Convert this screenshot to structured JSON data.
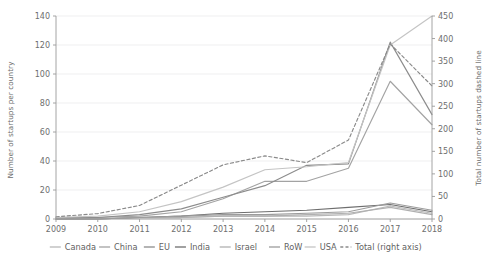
{
  "chart_data": {
    "type": "line",
    "title": "",
    "xlabel": "",
    "ylabel": "Number of startups per country",
    "y2label": "Total number of startups dashed line",
    "categories": [
      2009,
      2010,
      2011,
      2012,
      2013,
      2014,
      2015,
      2016,
      2017,
      2018
    ],
    "x": [
      2009,
      2010,
      2011,
      2012,
      2013,
      2014,
      2015,
      2016,
      2017,
      2018
    ],
    "xlim": [
      2009,
      2018
    ],
    "ylim": [
      0,
      140
    ],
    "y2lim": [
      0,
      450
    ],
    "yticks": [
      0,
      20,
      40,
      60,
      80,
      100,
      120,
      140
    ],
    "y2ticks": [
      0,
      50,
      100,
      150,
      200,
      250,
      300,
      350,
      400,
      450
    ],
    "xticks": [
      "2009",
      "2010",
      "2011",
      "2012",
      "2013",
      "2014",
      "2015",
      "2016",
      "2017",
      "2018"
    ],
    "grid": true,
    "legend_position": "bottom",
    "series": [
      {
        "name": "Canada",
        "axis": "left",
        "color": "#b8b8b8",
        "style": "solid",
        "values": [
          0,
          0,
          1,
          1,
          2,
          2,
          2,
          3,
          9,
          4
        ]
      },
      {
        "name": "China",
        "axis": "left",
        "color": "#a3a3a3",
        "style": "solid",
        "values": [
          0,
          1,
          2,
          5,
          14,
          26,
          26,
          35,
          95,
          65
        ]
      },
      {
        "name": "EU",
        "axis": "left",
        "color": "#8c8c8c",
        "style": "solid",
        "values": [
          1,
          1,
          3,
          7,
          15,
          23,
          37,
          38,
          122,
          72
        ]
      },
      {
        "name": "India",
        "axis": "left",
        "color": "#6e6e6e",
        "style": "solid",
        "values": [
          0,
          0,
          1,
          2,
          4,
          5,
          6,
          8,
          10,
          5
        ]
      },
      {
        "name": "Israel",
        "axis": "left",
        "color": "#b0b0b0",
        "style": "solid",
        "values": [
          0,
          0,
          1,
          1,
          2,
          2,
          3,
          4,
          8,
          3
        ]
      },
      {
        "name": "RoW",
        "axis": "left",
        "color": "#9c9c9c",
        "style": "solid",
        "values": [
          0,
          0,
          1,
          2,
          3,
          3,
          4,
          5,
          11,
          6
        ]
      },
      {
        "name": "USA",
        "axis": "left",
        "color": "#c4c4c4",
        "style": "solid",
        "values": [
          1,
          2,
          5,
          12,
          22,
          34,
          36,
          39,
          120,
          140
        ]
      },
      {
        "name": "Total (right axis)",
        "axis": "right",
        "color": "#8a8a8a",
        "style": "dashed",
        "values": [
          5,
          12,
          30,
          75,
          120,
          140,
          125,
          175,
          388,
          295
        ]
      }
    ]
  },
  "legend": {
    "entries": [
      {
        "label": "Canada",
        "color": "#b8b8b8",
        "style": "solid"
      },
      {
        "label": "China",
        "color": "#a3a3a3",
        "style": "solid"
      },
      {
        "label": "EU",
        "color": "#8c8c8c",
        "style": "solid"
      },
      {
        "label": "India",
        "color": "#6e6e6e",
        "style": "solid"
      },
      {
        "label": "Israel",
        "color": "#b0b0b0",
        "style": "solid"
      },
      {
        "label": "RoW",
        "color": "#9c9c9c",
        "style": "solid"
      },
      {
        "label": "USA",
        "color": "#c4c4c4",
        "style": "solid"
      },
      {
        "label": "Total (right axis)",
        "color": "#8a8a8a",
        "style": "dashed"
      }
    ]
  },
  "colors": {
    "background": "#ffffff",
    "grid": "#e8e8ea",
    "axis": "#9a9a9a",
    "text": "#6e6e6e"
  }
}
